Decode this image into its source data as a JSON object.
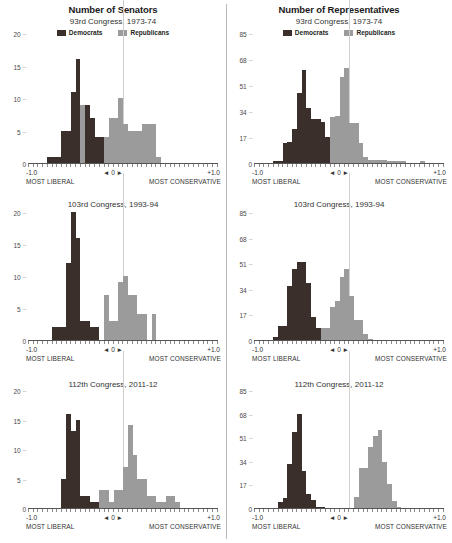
{
  "figure": {
    "columns": [
      {
        "title": "Number of Senators",
        "key": "senate"
      },
      {
        "title": "Number of Representatives",
        "key": "house"
      }
    ],
    "legend": [
      {
        "label": "Democrats",
        "color": "#3b2f2b"
      },
      {
        "label": "Republicans",
        "color": "#9b9b9b"
      }
    ],
    "zero_marker": "◄ 0 ►",
    "x_left_value": "-1.0",
    "x_right_value": "+1.0",
    "x_left_caption": "MOST LIBERAL",
    "x_right_caption": "MOST CONSERVATIVE",
    "rows": [
      {
        "subtitle": "93rd Congress, 1973-74"
      },
      {
        "subtitle": "103rd Congress, 1993-94"
      },
      {
        "subtitle": "112th Congress, 2011-12"
      }
    ]
  },
  "chart_data": [
    {
      "type": "bar",
      "title": "Number of Senators",
      "subtitle": "93rd Congress, 1973-74",
      "xlabel": "DW-NOMINATE first dimension (MOST LIBERAL to MOST CONSERVATIVE)",
      "ylabel": "Number of Senators",
      "ylim": [
        0,
        20
      ],
      "yticks": [
        0,
        5,
        10,
        15,
        20
      ],
      "xlim": [
        -1.0,
        1.0
      ],
      "xticks": [
        -1.0,
        0.0,
        1.0
      ],
      "bin_width": 0.05,
      "bin_starts": [
        -1.0,
        -0.95,
        -0.9,
        -0.85,
        -0.8,
        -0.75,
        -0.7,
        -0.65,
        -0.6,
        -0.55,
        -0.5,
        -0.45,
        -0.4,
        -0.35,
        -0.3,
        -0.25,
        -0.2,
        -0.15,
        -0.1,
        -0.05,
        0.0,
        0.05,
        0.1,
        0.15,
        0.2,
        0.25,
        0.3,
        0.35,
        0.4,
        0.45,
        0.5,
        0.55,
        0.6,
        0.65,
        0.7,
        0.75,
        0.8,
        0.85,
        0.9,
        0.95
      ],
      "grid": false,
      "legend_position": "top-center",
      "series": [
        {
          "name": "Democrats",
          "color": "#3b2f2b",
          "values": [
            0,
            0,
            0,
            0,
            1,
            1,
            1,
            5,
            5,
            11,
            16,
            8,
            9,
            7,
            4,
            4,
            3,
            1,
            1,
            0,
            0,
            0,
            0,
            0,
            0,
            0,
            0,
            0,
            0,
            0,
            0,
            0,
            0,
            0,
            0,
            0,
            0,
            0,
            0,
            0
          ]
        },
        {
          "name": "Republicans",
          "color": "#9b9b9b",
          "values": [
            0,
            0,
            0,
            0,
            0,
            0,
            0,
            0,
            0,
            0,
            0,
            9,
            7,
            3,
            3,
            4,
            4,
            7,
            7,
            10,
            6,
            5,
            5,
            5,
            6,
            6,
            6,
            1,
            0,
            0,
            0,
            0,
            0,
            0,
            0,
            0,
            0,
            0,
            0,
            0
          ]
        }
      ]
    },
    {
      "type": "bar",
      "title": "Number of Representatives",
      "subtitle": "93rd Congress, 1973-74",
      "xlabel": "DW-NOMINATE first dimension (MOST LIBERAL to MOST CONSERVATIVE)",
      "ylabel": "Number of Representatives",
      "ylim": [
        0,
        85
      ],
      "yticks": [
        0,
        17,
        34,
        51,
        68,
        85
      ],
      "xlim": [
        -1.0,
        1.0
      ],
      "xticks": [
        -1.0,
        0.0,
        1.0
      ],
      "bin_width": 0.05,
      "bin_starts": [
        -1.0,
        -0.95,
        -0.9,
        -0.85,
        -0.8,
        -0.75,
        -0.7,
        -0.65,
        -0.6,
        -0.55,
        -0.5,
        -0.45,
        -0.4,
        -0.35,
        -0.3,
        -0.25,
        -0.2,
        -0.15,
        -0.1,
        -0.05,
        0.0,
        0.05,
        0.1,
        0.15,
        0.2,
        0.25,
        0.3,
        0.35,
        0.4,
        0.45,
        0.5,
        0.55,
        0.6,
        0.65,
        0.7,
        0.75,
        0.8,
        0.85,
        0.9,
        0.95
      ],
      "grid": false,
      "legend_position": "top-center",
      "series": [
        {
          "name": "Democrats",
          "color": "#3b2f2b",
          "values": [
            0,
            0,
            0,
            0,
            1,
            1,
            13,
            14,
            22,
            46,
            61,
            36,
            29,
            29,
            27,
            17,
            13,
            7,
            5,
            0,
            0,
            0,
            0,
            0,
            0,
            0,
            0,
            0,
            0,
            0,
            0,
            0,
            0,
            0,
            0,
            0,
            0,
            0,
            0,
            0
          ]
        },
        {
          "name": "Republicans",
          "color": "#9b9b9b",
          "values": [
            0,
            0,
            0,
            0,
            0,
            0,
            0,
            0,
            0,
            0,
            0,
            0,
            0,
            0,
            0,
            0,
            30,
            31,
            56,
            62,
            26,
            26,
            13,
            4,
            2,
            2,
            2,
            2,
            1,
            1,
            1,
            1,
            0,
            0,
            0,
            1,
            0,
            0,
            0,
            0
          ]
        }
      ]
    },
    {
      "type": "bar",
      "title": "Number of Senators",
      "subtitle": "103rd Congress, 1993-94",
      "xlabel": "DW-NOMINATE first dimension (MOST LIBERAL to MOST CONSERVATIVE)",
      "ylabel": "Number of Senators",
      "ylim": [
        0,
        20
      ],
      "yticks": [
        0,
        5,
        10,
        15,
        20
      ],
      "xlim": [
        -1.0,
        1.0
      ],
      "xticks": [
        -1.0,
        0.0,
        1.0
      ],
      "bin_width": 0.05,
      "bin_starts": [
        -1.0,
        -0.95,
        -0.9,
        -0.85,
        -0.8,
        -0.75,
        -0.7,
        -0.65,
        -0.6,
        -0.55,
        -0.5,
        -0.45,
        -0.4,
        -0.35,
        -0.3,
        -0.25,
        -0.2,
        -0.15,
        -0.1,
        -0.05,
        0.0,
        0.05,
        0.1,
        0.15,
        0.2,
        0.25,
        0.3,
        0.35,
        0.4,
        0.45,
        0.5,
        0.55,
        0.6,
        0.65,
        0.7,
        0.75,
        0.8,
        0.85,
        0.9,
        0.95
      ],
      "grid": false,
      "legend_position": "none",
      "series": [
        {
          "name": "Democrats",
          "color": "#3b2f2b",
          "values": [
            0,
            0,
            0,
            0,
            0,
            2,
            2,
            2,
            12,
            20,
            16,
            3,
            3,
            2,
            2,
            0,
            0,
            0,
            0,
            0,
            0,
            0,
            0,
            0,
            0,
            0,
            0,
            0,
            0,
            0,
            0,
            0,
            0,
            0,
            0,
            0,
            0,
            0,
            0,
            0
          ]
        },
        {
          "name": "Republicans",
          "color": "#9b9b9b",
          "values": [
            0,
            0,
            0,
            0,
            0,
            0,
            0,
            0,
            0,
            0,
            0,
            0,
            0,
            0,
            0,
            0,
            7,
            3,
            3,
            9,
            10,
            7,
            7,
            4,
            4,
            0,
            4,
            0,
            0,
            0,
            0,
            0,
            0,
            0,
            0,
            0,
            0,
            0,
            0,
            0
          ]
        }
      ]
    },
    {
      "type": "bar",
      "title": "Number of Representatives",
      "subtitle": "103rd Congress, 1993-94",
      "xlabel": "DW-NOMINATE first dimension (MOST LIBERAL to MOST CONSERVATIVE)",
      "ylabel": "Number of Representatives",
      "ylim": [
        0,
        85
      ],
      "yticks": [
        0,
        17,
        34,
        51,
        68,
        85
      ],
      "xlim": [
        -1.0,
        1.0
      ],
      "xticks": [
        -1.0,
        0.0,
        1.0
      ],
      "bin_width": 0.05,
      "bin_starts": [
        -1.0,
        -0.95,
        -0.9,
        -0.85,
        -0.8,
        -0.75,
        -0.7,
        -0.65,
        -0.6,
        -0.55,
        -0.5,
        -0.45,
        -0.4,
        -0.35,
        -0.3,
        -0.25,
        -0.2,
        -0.15,
        -0.1,
        -0.05,
        0.0,
        0.05,
        0.1,
        0.15,
        0.2,
        0.25,
        0.3,
        0.35,
        0.4,
        0.45,
        0.5,
        0.55,
        0.6,
        0.65,
        0.7,
        0.75,
        0.8,
        0.85,
        0.9,
        0.95
      ],
      "grid": false,
      "legend_position": "none",
      "series": [
        {
          "name": "Democrats",
          "color": "#3b2f2b",
          "values": [
            0,
            0,
            0,
            0,
            2,
            9,
            9,
            36,
            47,
            52,
            52,
            38,
            15,
            8,
            0,
            0,
            0,
            0,
            0,
            0,
            0,
            0,
            0,
            0,
            0,
            0,
            0,
            0,
            0,
            0,
            0,
            0,
            0,
            0,
            0,
            0,
            0,
            0,
            0,
            0
          ]
        },
        {
          "name": "Republicans",
          "color": "#9b9b9b",
          "values": [
            0,
            0,
            0,
            0,
            0,
            0,
            0,
            0,
            0,
            0,
            0,
            0,
            0,
            0,
            8,
            8,
            22,
            26,
            42,
            47,
            29,
            13,
            13,
            4,
            1,
            0,
            0,
            0,
            0,
            0,
            0,
            0,
            0,
            0,
            0,
            0,
            0,
            0,
            0,
            0
          ]
        }
      ]
    },
    {
      "type": "bar",
      "title": "Number of Senators",
      "subtitle": "112th Congress, 2011-12",
      "xlabel": "DW-NOMINATE first dimension (MOST LIBERAL to MOST CONSERVATIVE)",
      "ylabel": "Number of Senators",
      "ylim": [
        0,
        20
      ],
      "yticks": [
        0,
        5,
        10,
        15,
        20
      ],
      "xlim": [
        -1.0,
        1.0
      ],
      "xticks": [
        -1.0,
        0.0,
        1.0
      ],
      "bin_width": 0.05,
      "bin_starts": [
        -1.0,
        -0.95,
        -0.9,
        -0.85,
        -0.8,
        -0.75,
        -0.7,
        -0.65,
        -0.6,
        -0.55,
        -0.5,
        -0.45,
        -0.4,
        -0.35,
        -0.3,
        -0.25,
        -0.2,
        -0.15,
        -0.1,
        -0.05,
        0.0,
        0.05,
        0.1,
        0.15,
        0.2,
        0.25,
        0.3,
        0.35,
        0.4,
        0.45,
        0.5,
        0.55,
        0.6,
        0.65,
        0.7,
        0.75,
        0.8,
        0.85,
        0.9,
        0.95
      ],
      "grid": false,
      "legend_position": "none",
      "series": [
        {
          "name": "Democrats",
          "color": "#3b2f2b",
          "values": [
            0,
            0,
            0,
            0,
            0,
            0,
            0,
            5,
            16,
            13,
            15,
            2,
            2,
            1,
            1,
            0,
            0,
            0,
            0,
            0,
            0,
            0,
            0,
            0,
            0,
            0,
            0,
            0,
            0,
            0,
            0,
            0,
            0,
            0,
            0,
            0,
            0,
            0,
            0,
            0
          ]
        },
        {
          "name": "Republicans",
          "color": "#9b9b9b",
          "values": [
            0,
            0,
            0,
            0,
            0,
            0,
            0,
            0,
            0,
            0,
            0,
            0,
            0,
            0,
            0,
            3,
            3,
            1,
            3,
            3,
            7,
            14,
            9,
            5,
            5,
            2,
            2,
            1,
            1,
            2,
            2,
            1,
            0,
            0,
            0,
            0,
            0,
            0,
            0,
            0
          ]
        }
      ]
    },
    {
      "type": "bar",
      "title": "Number of Representatives",
      "subtitle": "112th Congress, 2011-12",
      "xlabel": "DW-NOMINATE first dimension (MOST LIBERAL to MOST CONSERVATIVE)",
      "ylabel": "Number of Representatives",
      "ylim": [
        0,
        85
      ],
      "yticks": [
        0,
        17,
        34,
        51,
        68,
        85
      ],
      "xlim": [
        -1.0,
        1.0
      ],
      "xticks": [
        -1.0,
        0.0,
        1.0
      ],
      "bin_width": 0.05,
      "bin_starts": [
        -1.0,
        -0.95,
        -0.9,
        -0.85,
        -0.8,
        -0.75,
        -0.7,
        -0.65,
        -0.6,
        -0.55,
        -0.5,
        -0.45,
        -0.4,
        -0.35,
        -0.3,
        -0.25,
        -0.2,
        -0.15,
        -0.1,
        -0.05,
        0.0,
        0.05,
        0.1,
        0.15,
        0.2,
        0.25,
        0.3,
        0.35,
        0.4,
        0.45,
        0.5,
        0.55,
        0.6,
        0.65,
        0.7,
        0.75,
        0.8,
        0.85,
        0.9,
        0.95
      ],
      "grid": false,
      "legend_position": "none",
      "series": [
        {
          "name": "Democrats",
          "color": "#3b2f2b",
          "values": [
            0,
            0,
            0,
            0,
            0,
            4,
            7,
            32,
            55,
            68,
            27,
            10,
            6,
            1,
            1,
            0,
            0,
            0,
            0,
            0,
            0,
            0,
            0,
            0,
            0,
            0,
            0,
            0,
            0,
            0,
            0,
            0,
            0,
            0,
            0,
            0,
            0,
            0,
            0,
            0
          ]
        },
        {
          "name": "Republicans",
          "color": "#9b9b9b",
          "values": [
            0,
            0,
            0,
            0,
            0,
            0,
            0,
            0,
            0,
            0,
            0,
            0,
            0,
            0,
            0,
            0,
            0,
            0,
            0,
            0,
            0,
            8,
            29,
            29,
            44,
            52,
            56,
            33,
            17,
            5,
            1,
            0,
            0,
            0,
            0,
            0,
            0,
            0,
            0,
            0
          ]
        }
      ]
    }
  ]
}
